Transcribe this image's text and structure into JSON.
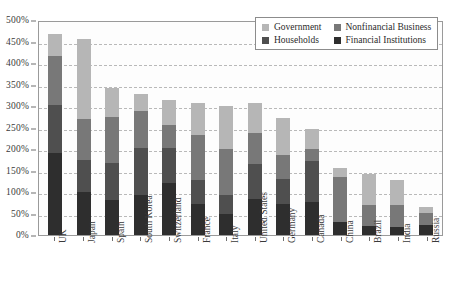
{
  "chart_data": {
    "type": "bar",
    "subtype": "stacked-bar",
    "title": "",
    "xlabel": "",
    "ylabel": "",
    "ylim": [
      0,
      500
    ],
    "y_tick_step": 50,
    "y_tick_labels": [
      "500%",
      "450%",
      "400%",
      "350%",
      "300%",
      "250%",
      "200%",
      "150%",
      "100%",
      "50%",
      "0%"
    ],
    "y_tick_values": [
      500,
      450,
      400,
      350,
      300,
      250,
      200,
      150,
      100,
      50,
      0
    ],
    "grid": true,
    "grid_style": "dashed-horizontal",
    "legend_position": "top-right",
    "units": "percent of GDP",
    "categories": [
      "UK",
      "Japan",
      "Spain",
      "South Korea",
      "Switzerland",
      "France",
      "Italy",
      "United States",
      "Germany",
      "Canada",
      "China",
      "Brazil",
      "India",
      "Russia"
    ],
    "series": [
      {
        "name": "Financial Institutions",
        "color": "#2e2e2e",
        "values": [
          190,
          100,
          82,
          92,
          122,
          73,
          48,
          84,
          72,
          77,
          30,
          22,
          18,
          24
        ]
      },
      {
        "name": "Households",
        "color": "#4f4f4f",
        "values": [
          113,
          75,
          86,
          110,
          80,
          55,
          44,
          81,
          59,
          96,
          0,
          0,
          0,
          0
        ]
      },
      {
        "name": "Nonfinancial Business",
        "color": "#787878",
        "values": [
          114,
          95,
          106,
          86,
          53,
          105,
          107,
          73,
          54,
          27,
          105,
          48,
          52,
          28
        ]
      },
      {
        "name": "Government",
        "color": "#b6b6b6",
        "values": [
          50,
          187,
          68,
          41,
          59,
          74,
          102,
          68,
          88,
          46,
          22,
          72,
          58,
          13
        ]
      }
    ],
    "totals": [
      467,
      457,
      342,
      329,
      314,
      307,
      301,
      306,
      273,
      246,
      157,
      142,
      128,
      65
    ],
    "stack_order_bottom_to_top": [
      "Financial Institutions",
      "Households",
      "Nonfinancial Business",
      "Government"
    ]
  },
  "legend": {
    "items": [
      {
        "label": "Government",
        "color": "#b6b6b6",
        "swatch_name": "legend-swatch-government"
      },
      {
        "label": "Nonfinancial Business",
        "color": "#787878",
        "swatch_name": "legend-swatch-nonfinancial-business"
      },
      {
        "label": "Households",
        "color": "#4f4f4f",
        "swatch_name": "legend-swatch-households"
      },
      {
        "label": "Financial Institutions",
        "color": "#2e2e2e",
        "swatch_name": "legend-swatch-financial-institutions"
      }
    ]
  },
  "colors": {
    "background": "#ffffff",
    "plot_background": "#fdfdfd",
    "axis": "#6f6f6f",
    "gridline": "#b9b9b9",
    "text": "#2b2b2b"
  }
}
